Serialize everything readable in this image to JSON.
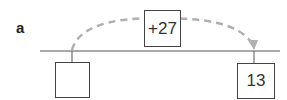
{
  "label": "a",
  "operation": "+27",
  "start_value": "",
  "end_value": "13",
  "colors": {
    "arrow": "#b0b0b0",
    "line": "#555555"
  }
}
